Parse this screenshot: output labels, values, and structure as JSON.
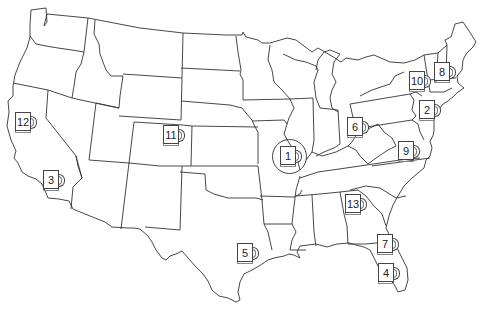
{
  "map": {
    "title": "Contiguous United States",
    "style": {
      "outline_color": "#333333",
      "fill_color": "#ffffff",
      "background": "#ffffff"
    }
  },
  "markers": [
    {
      "label": "1",
      "icon": "mug-icon",
      "x": 280,
      "y": 146,
      "highlighted": true
    },
    {
      "label": "2",
      "icon": "mug-icon",
      "x": 419,
      "y": 100,
      "highlighted": false
    },
    {
      "label": "3",
      "icon": "mug-icon",
      "x": 43,
      "y": 170,
      "highlighted": false
    },
    {
      "label": "4",
      "icon": "mug-icon",
      "x": 378,
      "y": 263,
      "highlighted": false
    },
    {
      "label": "5",
      "icon": "mug-icon",
      "x": 237,
      "y": 243,
      "highlighted": false
    },
    {
      "label": "6",
      "icon": "mug-icon",
      "x": 347,
      "y": 117,
      "highlighted": false
    },
    {
      "label": "7",
      "icon": "mug-icon",
      "x": 377,
      "y": 234,
      "highlighted": false
    },
    {
      "label": "8",
      "icon": "mug-icon",
      "x": 434,
      "y": 62,
      "highlighted": false
    },
    {
      "label": "9",
      "icon": "mug-icon",
      "x": 398,
      "y": 141,
      "highlighted": false
    },
    {
      "label": "10",
      "icon": "mug-icon",
      "x": 409,
      "y": 71,
      "highlighted": false
    },
    {
      "label": "11",
      "icon": "mug-icon",
      "x": 163,
      "y": 125,
      "highlighted": false
    },
    {
      "label": "12",
      "icon": "mug-icon",
      "x": 15,
      "y": 112,
      "highlighted": false
    },
    {
      "label": "13",
      "icon": "mug-icon",
      "x": 345,
      "y": 194,
      "highlighted": false
    }
  ]
}
